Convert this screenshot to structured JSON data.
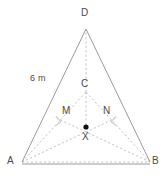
{
  "figure": {
    "name": "tetrahedron-pyramid-diagram",
    "colors": {
      "solid_edge": "#9a9a9a",
      "hidden_edge": "#c4c4c4",
      "label_text": "#4a4a4a",
      "point_marker": "#111111",
      "background": "#ffffff"
    },
    "canvas": {
      "width": 164,
      "height": 180
    }
  },
  "labels": {
    "apex_d": "D",
    "back_vertex_c": "C",
    "midpoint_m": "M",
    "midpoint_n": "N",
    "centre_x": "X",
    "vertex_a": "A",
    "vertex_b": "B",
    "edge_measure": "6 m"
  },
  "label_positions": {
    "apex_d": {
      "x": 81,
      "y": 8
    },
    "back_vertex_c": {
      "x": 81,
      "y": 79
    },
    "midpoint_m": {
      "x": 62,
      "y": 107
    },
    "midpoint_n": {
      "x": 102,
      "y": 107
    },
    "centre_x": {
      "x": 82,
      "y": 133
    },
    "vertex_a": {
      "x": 8,
      "y": 157
    },
    "vertex_b": {
      "x": 152,
      "y": 157
    },
    "edge_measure": {
      "x": 30,
      "y": 75
    }
  },
  "geometry": {
    "points": {
      "A": {
        "x": 22,
        "y": 162
      },
      "B": {
        "x": 150,
        "y": 162
      },
      "C": {
        "x": 86,
        "y": 92
      },
      "D": {
        "x": 86,
        "y": 29
      },
      "M": {
        "x": 61,
        "y": 122
      },
      "N": {
        "x": 114,
        "y": 122
      },
      "X": {
        "x": 86,
        "y": 127
      }
    },
    "solid_edges": [
      {
        "name": "edge-AD",
        "from": "A",
        "to": "D"
      },
      {
        "name": "edge-BD",
        "from": "B",
        "to": "D"
      },
      {
        "name": "edge-AB",
        "from": "A",
        "to": "B"
      }
    ],
    "hidden_edges": [
      {
        "name": "edge-AC",
        "from": "A",
        "to": "C"
      },
      {
        "name": "edge-BC",
        "from": "B",
        "to": "C"
      },
      {
        "name": "edge-CD",
        "from": "C",
        "to": "D"
      },
      {
        "name": "edge-AN",
        "from": "A",
        "to": "N"
      },
      {
        "name": "edge-BM",
        "from": "B",
        "to": "M"
      },
      {
        "name": "edge-CX",
        "from": "C",
        "to": "X"
      }
    ],
    "right_angle_marks": [
      {
        "name": "right-angle-mark-m",
        "x": 57,
        "y": 117,
        "size": 7,
        "rotation": -28
      },
      {
        "name": "right-angle-mark-n",
        "x": 111,
        "y": 117,
        "size": 7,
        "rotation": 28
      }
    ],
    "marked_point": {
      "name": "centre-point-x",
      "x": 86,
      "y": 127,
      "radius": 2.6
    }
  }
}
